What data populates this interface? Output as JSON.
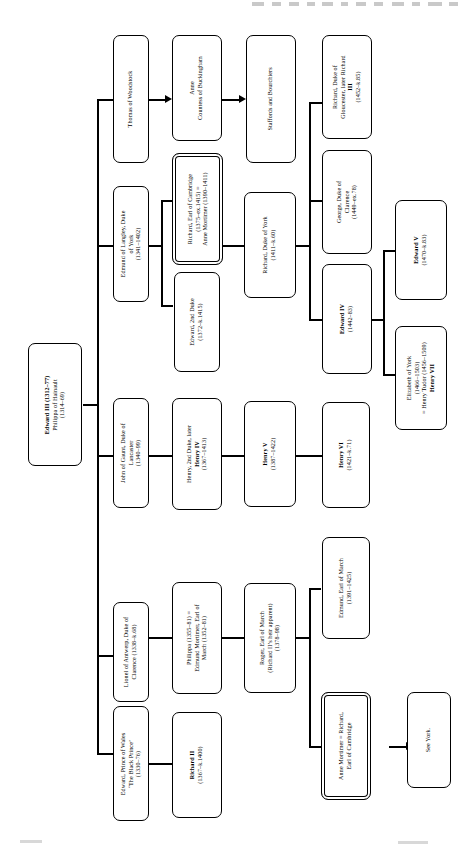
{
  "diagram": {
    "type": "family-tree",
    "orientation": "rotated-90-ccw",
    "nodes": [
      {
        "id": "edward3",
        "lines": [
          "Edward III (1312–77)",
          "Philippa of Hainault",
          "(1314–69)"
        ],
        "bold_lines": [
          0
        ],
        "style": "single"
      },
      {
        "id": "blackprince",
        "lines": [
          "Edward, Prince of Wales",
          "‘The Black Prince’",
          "(1330–76)"
        ],
        "bold_lines": [],
        "style": "single"
      },
      {
        "id": "lionel",
        "lines": [
          "Lionel of Antwerp, Duke of",
          "Clarence (1338–k.68)"
        ],
        "bold_lines": [],
        "style": "single"
      },
      {
        "id": "gaunt",
        "lines": [
          "John of Gaunt, Duke of",
          "Lancaster",
          "(1340–99)"
        ],
        "bold_lines": [],
        "style": "single"
      },
      {
        "id": "langley",
        "lines": [
          "Edmund of Langley, Duke",
          "of York",
          "(1341–1402)"
        ],
        "bold_lines": [],
        "style": "single"
      },
      {
        "id": "woodstock",
        "lines": [
          "Thomas of Woodstock"
        ],
        "bold_lines": [],
        "style": "single"
      },
      {
        "id": "richard2",
        "lines": [
          "Richard II",
          "(1367–k.1400)"
        ],
        "bold_lines": [
          0
        ],
        "style": "single"
      },
      {
        "id": "philippa",
        "lines": [
          "Philippa  (1355–81) =",
          "Edmund Mortimer, Earl of",
          "March (1352–81)"
        ],
        "bold_lines": [],
        "style": "single"
      },
      {
        "id": "henry4",
        "lines": [
          "Henry, 2nd Duke, later",
          "Henry IV",
          "(1367–1413)"
        ],
        "bold_lines": [
          1
        ],
        "style": "single"
      },
      {
        "id": "edward2duke",
        "lines": [
          "Edward, 2nd Duke",
          "(1372–k.1415)"
        ],
        "bold_lines": [],
        "style": "single"
      },
      {
        "id": "cambridge",
        "lines": [
          "Richard, Earl of Cambridge",
          "(1375–ex.1415) =",
          "Anne Mortimer (1390–1411)"
        ],
        "bold_lines": [],
        "style": "double"
      },
      {
        "id": "anne_buck",
        "lines": [
          "Anne",
          "Countess of Buckingham"
        ],
        "bold_lines": [],
        "style": "single"
      },
      {
        "id": "roger",
        "lines": [
          "Roger, Earl of March",
          "(Richard II’s heir apparent)",
          "(1378–98)"
        ],
        "bold_lines": [],
        "style": "single"
      },
      {
        "id": "henry5",
        "lines": [
          "Henry V",
          "(1387–1422)"
        ],
        "bold_lines": [
          0
        ],
        "style": "single"
      },
      {
        "id": "richard_york",
        "lines": [
          "Richard, Duke of York",
          "(1411–k.60)"
        ],
        "bold_lines": [],
        "style": "single"
      },
      {
        "id": "staffords",
        "lines": [
          "Staffords and Bourchiers"
        ],
        "bold_lines": [],
        "style": "single"
      },
      {
        "id": "anne_mort_rich",
        "lines": [
          "Anne Mortimer = Richard,",
          "Earl of Cambridge"
        ],
        "bold_lines": [],
        "style": "double"
      },
      {
        "id": "edmund_march",
        "lines": [
          "Edmund, Earl of March",
          "(1391–1425)"
        ],
        "bold_lines": [],
        "style": "single"
      },
      {
        "id": "henry6",
        "lines": [
          "Henry VI",
          "(1421–k.71)"
        ],
        "bold_lines": [
          0
        ],
        "style": "single"
      },
      {
        "id": "edward4",
        "lines": [
          "Edward IV",
          "(1442–83)"
        ],
        "bold_lines": [
          0
        ],
        "style": "single"
      },
      {
        "id": "george",
        "lines": [
          "George, Duke of",
          "Clarence",
          "(1449–ex.78)"
        ],
        "bold_lines": [],
        "style": "single"
      },
      {
        "id": "gloucester",
        "lines": [
          "Richard, Duke of",
          "Gloucester, later Richard",
          "III",
          "(1452–k.85)"
        ],
        "bold_lines": [
          2
        ],
        "style": "single"
      },
      {
        "id": "see_york",
        "lines": [
          "See York."
        ],
        "bold_lines": [],
        "style": "single"
      },
      {
        "id": "elizabeth",
        "lines": [
          "Elizabeth of York",
          "(1466–1503)",
          "= Henry Tudor (1456–1509)",
          "Henry VII"
        ],
        "bold_lines": [
          3
        ],
        "style": "single"
      },
      {
        "id": "edward5",
        "lines": [
          "Edward V",
          "(1470–k.83)"
        ],
        "bold_lines": [
          0
        ],
        "style": "single"
      }
    ]
  }
}
